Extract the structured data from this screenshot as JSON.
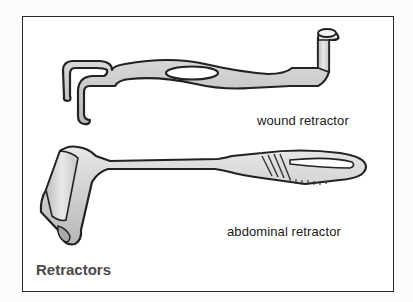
{
  "figure": {
    "title": "Retractors",
    "labels": {
      "wound": "wound retractor",
      "abdominal": "abdominal retractor"
    },
    "colors": {
      "outline": "#2a2a2a",
      "metal_fill": "#c9c9c9",
      "metal_highlight": "#e6e6e6",
      "title": "#4a4a4a",
      "label": "#1a1a1a"
    },
    "illustrations": [
      {
        "name": "wound retractor",
        "icon": "wound-retractor-illustration"
      },
      {
        "name": "abdominal retractor",
        "icon": "abdominal-retractor-illustration"
      }
    ]
  }
}
